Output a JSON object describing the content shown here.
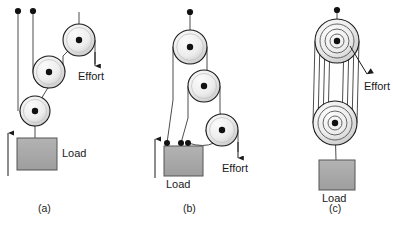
{
  "figure": {
    "title_visible": false,
    "background_color": "#ffffff",
    "panels": [
      {
        "id": "a",
        "caption": "(a)",
        "caption_x": 45,
        "caption_y": 212,
        "labels": [
          {
            "name": "load-label",
            "text": "Load",
            "x": 62,
            "y": 157
          },
          {
            "name": "effort-label",
            "text": "Effort",
            "x": 78,
            "y": 76
          }
        ],
        "anchors": [
          {
            "x": 18,
            "y": 11
          },
          {
            "x": 33,
            "y": 11
          }
        ],
        "pulleys": [
          {
            "name": "pulley-top",
            "cx": 79,
            "cy": 40,
            "r": 16
          },
          {
            "name": "pulley-middle",
            "cx": 49,
            "cy": 72,
            "r": 16
          },
          {
            "name": "pulley-bottom",
            "cx": 35,
            "cy": 111,
            "r": 15
          }
        ],
        "load_block": {
          "x": 17,
          "y": 138,
          "w": 40,
          "h": 32
        },
        "direction_arrow": {
          "name": "load-direction-arrow",
          "x": 8,
          "y_from": 176,
          "y_to": 132,
          "direction": "up"
        },
        "effort_arrow": {
          "name": "effort-direction-arrow",
          "x": 95,
          "y_from": 40,
          "y_to": 66,
          "direction": "down"
        }
      },
      {
        "id": "b",
        "caption": "(b)",
        "caption_x": 190,
        "caption_y": 212,
        "labels": [
          {
            "name": "load-label",
            "text": "Load",
            "x": 168,
            "y": 187
          },
          {
            "name": "effort-label",
            "text": "Effort",
            "x": 222,
            "y": 170
          }
        ],
        "anchors": [
          {
            "x": 190,
            "y": 12
          }
        ],
        "pulleys": [
          {
            "name": "pulley-top",
            "cx": 190,
            "cy": 47,
            "r": 17
          },
          {
            "name": "pulley-middle",
            "cx": 204,
            "cy": 86,
            "r": 16
          },
          {
            "name": "pulley-bottom",
            "cx": 222,
            "cy": 130,
            "r": 16
          }
        ],
        "load_block": {
          "x": 164,
          "y": 146,
          "w": 39,
          "h": 30
        },
        "load_attachments": [
          {
            "x": 167,
            "y": 143
          },
          {
            "x": 181,
            "y": 143
          },
          {
            "x": 188,
            "y": 143
          }
        ],
        "direction_arrow": {
          "name": "load-direction-arrow",
          "x": 155,
          "y_from": 178,
          "y_to": 138,
          "direction": "up"
        },
        "effort_arrow": {
          "name": "effort-direction-arrow",
          "x": 238,
          "y_from": 130,
          "y_to": 158,
          "direction": "down"
        }
      },
      {
        "id": "c",
        "caption": "(c)",
        "caption_x": 336,
        "caption_y": 212,
        "labels": [
          {
            "name": "load-label",
            "text": "Load",
            "x": 336,
            "y": 199
          },
          {
            "name": "effort-label",
            "text": "Effort",
            "x": 366,
            "y": 86
          }
        ],
        "anchors": [
          {
            "x": 337,
            "y": 10
          }
        ],
        "pulleys": [
          {
            "name": "pulley-block-top",
            "cx": 337,
            "cy": 41,
            "radii": [
              22,
              17,
              12,
              7
            ]
          },
          {
            "name": "pulley-block-bottom",
            "cx": 335,
            "cy": 123,
            "radii": [
              22,
              17,
              12,
              7
            ]
          }
        ],
        "load_block": {
          "x": 319,
          "y": 160,
          "w": 36,
          "h": 30
        },
        "effort_arrow": {
          "name": "effort-direction-arrow",
          "x_from": 350,
          "y_from": 46,
          "x_to": 368,
          "y_to": 76,
          "direction": "down-right"
        }
      }
    ],
    "colors": {
      "rope": "#4d4d4d",
      "pulley_stroke": "#1a1a1a",
      "pulley_fill_light": "#f2f2f2",
      "pulley_fill_shadow": "#c9c9c9",
      "load_fill": "#a8a8a8",
      "load_stroke": "#555555",
      "text": "#1a1a1a",
      "arrow": "#1a1a1a",
      "background": "#ffffff"
    }
  }
}
